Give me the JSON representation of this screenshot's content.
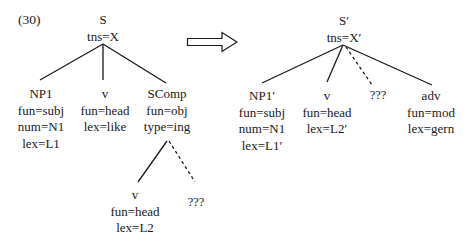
{
  "example_number": "(30)",
  "left_tree": {
    "root": {
      "cat": "S",
      "features": [
        "tns=X"
      ]
    },
    "children": [
      {
        "cat": "NP1",
        "features": [
          "fun=subj",
          "num=N1",
          "lex=L1"
        ]
      },
      {
        "cat": "v",
        "features": [
          "fun=head",
          "lex=like"
        ]
      },
      {
        "cat": "SComp",
        "features": [
          "fun=obj",
          "type=ing"
        ],
        "children": [
          {
            "cat": "v",
            "features": [
              "fun=head",
              "lex=L2"
            ]
          },
          {
            "cat": "???",
            "features": [],
            "dashed": true
          }
        ]
      }
    ]
  },
  "arrow": {
    "icon": "right-hollow-arrow-icon"
  },
  "right_tree": {
    "root": {
      "cat": "S′",
      "features": [
        "tns=X′"
      ]
    },
    "children": [
      {
        "cat": "NP1′",
        "features": [
          "fun=subj",
          "num=N1",
          "lex=L1′"
        ]
      },
      {
        "cat": "v",
        "features": [
          "fun=head",
          "lex=L2′"
        ]
      },
      {
        "cat": "???",
        "features": [],
        "dashed": true
      },
      {
        "cat": "adv",
        "features": [
          "fun=mod",
          "lex=gern"
        ]
      }
    ]
  },
  "colors": {
    "ink": "#1a1a1a",
    "background": "#ffffff"
  }
}
